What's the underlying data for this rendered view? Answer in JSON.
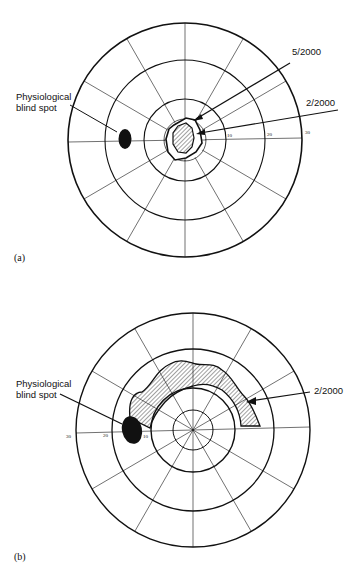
{
  "figure": {
    "panel_a": {
      "panel_label": "(a)",
      "blind_spot_label_line1": "Physiological",
      "blind_spot_label_line2": "blind spot",
      "outer_isopter_label": "5/2000",
      "inner_isopter_label": "2/2000",
      "tick_labels": [
        "10",
        "20",
        "30"
      ]
    },
    "panel_b": {
      "panel_label": "(b)",
      "blind_spot_label_line1": "Physiological",
      "blind_spot_label_line2": "blind spot",
      "scotoma_label": "2/2000",
      "tick_labels": [
        "10",
        "20",
        "30"
      ]
    },
    "colors": {
      "ink": "#111111",
      "background": "#ffffff"
    }
  }
}
